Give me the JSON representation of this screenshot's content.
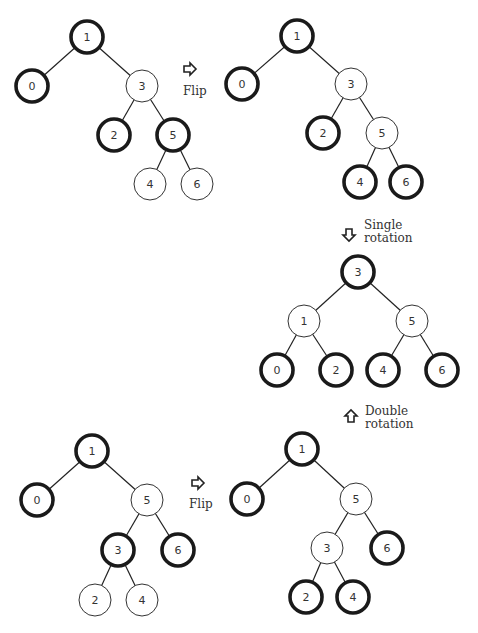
{
  "colors": {
    "stroke": "#1a1a1a",
    "fill": "#ffffff",
    "text": "#333333"
  },
  "node_radius": 16,
  "trees": [
    {
      "id": "tree-top-left",
      "nodes": [
        {
          "label": "1",
          "x": 87,
          "y": 37,
          "thick": true
        },
        {
          "label": "0",
          "x": 32,
          "y": 86,
          "thick": true
        },
        {
          "label": "3",
          "x": 142,
          "y": 86,
          "thick": false
        },
        {
          "label": "2",
          "x": 114,
          "y": 135,
          "thick": true
        },
        {
          "label": "5",
          "x": 173,
          "y": 135,
          "thick": true
        },
        {
          "label": "4",
          "x": 150,
          "y": 184,
          "thick": false
        },
        {
          "label": "6",
          "x": 197,
          "y": 184,
          "thick": false
        }
      ],
      "edges": [
        [
          0,
          1
        ],
        [
          0,
          2
        ],
        [
          2,
          3
        ],
        [
          2,
          4
        ],
        [
          4,
          5
        ],
        [
          4,
          6
        ]
      ]
    },
    {
      "id": "tree-top-right",
      "nodes": [
        {
          "label": "1",
          "x": 297,
          "y": 36,
          "thick": true
        },
        {
          "label": "0",
          "x": 242,
          "y": 84,
          "thick": true
        },
        {
          "label": "3",
          "x": 351,
          "y": 84,
          "thick": false
        },
        {
          "label": "2",
          "x": 323,
          "y": 133,
          "thick": true
        },
        {
          "label": "5",
          "x": 382,
          "y": 133,
          "thick": false
        },
        {
          "label": "4",
          "x": 360,
          "y": 182,
          "thick": true
        },
        {
          "label": "6",
          "x": 406,
          "y": 182,
          "thick": true
        }
      ],
      "edges": [
        [
          0,
          1
        ],
        [
          0,
          2
        ],
        [
          2,
          3
        ],
        [
          2,
          4
        ],
        [
          4,
          5
        ],
        [
          4,
          6
        ]
      ]
    },
    {
      "id": "tree-middle",
      "nodes": [
        {
          "label": "3",
          "x": 358,
          "y": 272,
          "thick": true
        },
        {
          "label": "1",
          "x": 304,
          "y": 321,
          "thick": false
        },
        {
          "label": "5",
          "x": 412,
          "y": 321,
          "thick": false
        },
        {
          "label": "0",
          "x": 277,
          "y": 370,
          "thick": true
        },
        {
          "label": "2",
          "x": 336,
          "y": 370,
          "thick": true
        },
        {
          "label": "4",
          "x": 383,
          "y": 370,
          "thick": true
        },
        {
          "label": "6",
          "x": 442,
          "y": 370,
          "thick": true
        }
      ],
      "edges": [
        [
          0,
          1
        ],
        [
          0,
          2
        ],
        [
          1,
          3
        ],
        [
          1,
          4
        ],
        [
          2,
          5
        ],
        [
          2,
          6
        ]
      ]
    },
    {
      "id": "tree-bottom-left",
      "nodes": [
        {
          "label": "1",
          "x": 92,
          "y": 451,
          "thick": true
        },
        {
          "label": "0",
          "x": 37,
          "y": 500,
          "thick": true
        },
        {
          "label": "5",
          "x": 147,
          "y": 500,
          "thick": false
        },
        {
          "label": "3",
          "x": 118,
          "y": 550,
          "thick": true
        },
        {
          "label": "6",
          "x": 178,
          "y": 550,
          "thick": true
        },
        {
          "label": "2",
          "x": 95,
          "y": 600,
          "thick": false
        },
        {
          "label": "4",
          "x": 142,
          "y": 600,
          "thick": false
        }
      ],
      "edges": [
        [
          0,
          1
        ],
        [
          0,
          2
        ],
        [
          2,
          3
        ],
        [
          2,
          4
        ],
        [
          3,
          5
        ],
        [
          3,
          6
        ]
      ]
    },
    {
      "id": "tree-bottom-right",
      "nodes": [
        {
          "label": "1",
          "x": 302,
          "y": 449,
          "thick": true
        },
        {
          "label": "0",
          "x": 247,
          "y": 499,
          "thick": true
        },
        {
          "label": "5",
          "x": 356,
          "y": 499,
          "thick": false
        },
        {
          "label": "3",
          "x": 327,
          "y": 548,
          "thick": false
        },
        {
          "label": "6",
          "x": 387,
          "y": 548,
          "thick": true
        },
        {
          "label": "2",
          "x": 306,
          "y": 597,
          "thick": true
        },
        {
          "label": "4",
          "x": 353,
          "y": 597,
          "thick": true
        }
      ],
      "edges": [
        [
          0,
          1
        ],
        [
          0,
          2
        ],
        [
          2,
          3
        ],
        [
          2,
          4
        ],
        [
          3,
          5
        ],
        [
          3,
          6
        ]
      ]
    }
  ],
  "transitions": [
    {
      "id": "flip-top",
      "direction": "right",
      "lines": [
        "Flip"
      ],
      "arrow": {
        "x": 190,
        "y": 69
      },
      "text": {
        "x": 183,
        "y": 95
      }
    },
    {
      "id": "single-rotation",
      "direction": "down",
      "lines": [
        "Single",
        "rotation"
      ],
      "arrow": {
        "x": 349,
        "y": 235
      },
      "text": {
        "x": 364,
        "y": 229
      }
    },
    {
      "id": "double-rotation",
      "direction": "up",
      "lines": [
        "Double",
        "rotation"
      ],
      "arrow": {
        "x": 351,
        "y": 416
      },
      "text": {
        "x": 365,
        "y": 415
      }
    },
    {
      "id": "flip-bottom",
      "direction": "right",
      "lines": [
        "Flip"
      ],
      "arrow": {
        "x": 198,
        "y": 483
      },
      "text": {
        "x": 189,
        "y": 508
      }
    }
  ]
}
